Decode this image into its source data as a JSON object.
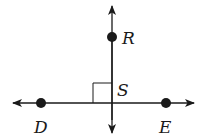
{
  "diagram": {
    "type": "geometry-perpendicular-lines",
    "stroke_color": "#1a1a1a",
    "points": {
      "R": {
        "label": "R",
        "x": 112,
        "y": 37
      },
      "D": {
        "label": "D",
        "x": 41,
        "y": 103
      },
      "E": {
        "label": "E",
        "x": 166,
        "y": 103
      },
      "S": {
        "label": "S",
        "x": 112,
        "y": 103
      }
    },
    "lines": [
      {
        "name": "vertical-line",
        "through": [
          "R",
          "S"
        ],
        "arrows": "both"
      },
      {
        "name": "horizontal-line",
        "through": [
          "D",
          "E"
        ],
        "arrows": "both"
      }
    ],
    "right_angle_marker": {
      "at": "S",
      "size": 19
    }
  }
}
